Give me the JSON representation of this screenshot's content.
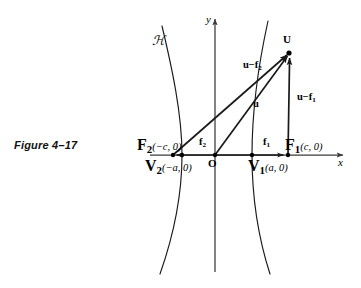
{
  "figure": {
    "caption": "Figure 4–17",
    "curve_label": "ℋ"
  },
  "axes": {
    "x_label": "x",
    "y_label": "y",
    "origin_label": "O"
  },
  "points": [
    {
      "name": "focus-left",
      "label_main": "F",
      "label_sub": "2",
      "label_coord": "(−c, 0)",
      "x": 173,
      "y": 155
    },
    {
      "name": "vertex-left",
      "label_main": "V",
      "label_sub": "2",
      "label_coord": "(−a, 0)",
      "x": 182,
      "y": 155
    },
    {
      "name": "origin",
      "label_main": "O",
      "label_sub": "",
      "label_coord": "",
      "x": 215,
      "y": 155
    },
    {
      "name": "vertex-right",
      "label_main": "V",
      "label_sub": "1",
      "label_coord": "(a, 0)",
      "x": 252,
      "y": 155
    },
    {
      "name": "focus-right",
      "label_main": "F",
      "label_sub": "1",
      "label_coord": "(c, 0)",
      "x": 287,
      "y": 155
    },
    {
      "name": "point-u",
      "label_main": "U",
      "label_sub": "",
      "label_coord": "",
      "x": 290,
      "y": 52
    }
  ],
  "labels": {
    "focus_left": {
      "main": "F",
      "sub": "2",
      "coord": "(−c, 0)"
    },
    "vertex_left": {
      "main": "V",
      "sub": "2",
      "coord": "(−a, 0)"
    },
    "focus_right": {
      "main": "F",
      "sub": "1",
      "coord": "(c, 0)"
    },
    "vertex_right": {
      "main": "V",
      "sub": "1",
      "coord": "(a, 0)"
    },
    "point_u": "U",
    "origin": "O"
  },
  "vectors": [
    {
      "name": "u-minus-f2",
      "main": "u",
      "op": "−",
      "term": "f",
      "sub": "2"
    },
    {
      "name": "u",
      "main": "u",
      "op": "",
      "term": "",
      "sub": ""
    },
    {
      "name": "u-minus-f1",
      "main": "u",
      "op": "−",
      "term": "f",
      "sub": "1"
    },
    {
      "name": "f2",
      "main": "f",
      "op": "",
      "term": "",
      "sub": "2"
    },
    {
      "name": "f1",
      "main": "f",
      "op": "",
      "term": "",
      "sub": "1"
    }
  ],
  "vector_labels": {
    "u_minus_f2": {
      "head": "u",
      "minus": "−",
      "tail": "f",
      "sub": "2"
    },
    "u_only": {
      "head": "u"
    },
    "u_minus_f1": {
      "head": "u",
      "minus": "−",
      "tail": "f",
      "sub": "1"
    },
    "f2": {
      "head": "f",
      "sub": "2"
    },
    "f1": {
      "head": "f",
      "sub": "1"
    }
  },
  "colors": {
    "ink": "#1a1a1a",
    "axis": "#3a3a3a",
    "background": "#ffffff"
  },
  "geometry": {
    "origin_px": {
      "x": 215,
      "y": 155
    },
    "a_px": 37,
    "c_px": 72,
    "u_px": {
      "x": 290,
      "y": 52
    },
    "x_axis_span": {
      "x1": 150,
      "x2": 347
    },
    "y_axis_span": {
      "y1": 16,
      "y2": 272
    }
  }
}
